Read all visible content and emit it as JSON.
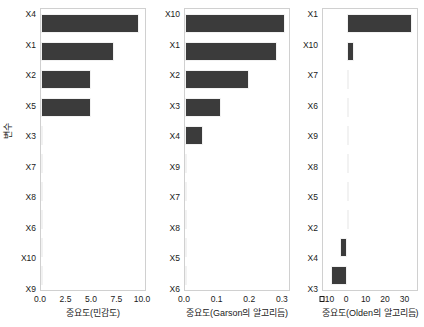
{
  "figure": {
    "y_axis_title": "변수",
    "bar_color": "#3b3b3b",
    "panel_border_color": "#d0d0d0"
  },
  "chart_data": [
    {
      "type": "bar",
      "orientation": "horizontal",
      "title": "",
      "xlabel": "중요도(민감도)",
      "ylabel": "변수",
      "xlim": [
        0.0,
        10.4
      ],
      "xticks": [
        0.0,
        2.5,
        5.0,
        7.5,
        10.0
      ],
      "xticklabels": [
        "0.0",
        "2.5",
        "5.0",
        "7.5",
        "10.0"
      ],
      "grid": false,
      "categories": [
        "X4",
        "X1",
        "X2",
        "X5",
        "X3",
        "X7",
        "X8",
        "X6",
        "X10",
        "X9"
      ],
      "values": [
        9.8,
        7.25,
        5.0,
        4.95,
        0.12,
        0.02,
        0.02,
        0.02,
        0.01,
        0.01
      ]
    },
    {
      "type": "bar",
      "orientation": "horizontal",
      "title": "",
      "xlabel": "중요도(Garson의 알고리듬)",
      "ylabel": "",
      "xlim": [
        0.0,
        0.325
      ],
      "xticks": [
        0.0,
        0.1,
        0.2,
        0.3
      ],
      "xticklabels": [
        "0.0",
        "0.1",
        "0.2",
        "0.3"
      ],
      "grid": false,
      "categories": [
        "X10",
        "X1",
        "X2",
        "X3",
        "X4",
        "X9",
        "X7",
        "X8",
        "X5",
        "X6"
      ],
      "values": [
        0.311,
        0.286,
        0.201,
        0.114,
        0.056,
        0.004,
        0.004,
        0.003,
        0.003,
        0.003
      ]
    },
    {
      "type": "bar",
      "orientation": "horizontal",
      "title": "",
      "xlabel": "중요도(Olden의 알고리듬)",
      "ylabel": "",
      "xlim": [
        -12.5,
        37.0
      ],
      "xticks": [
        -10,
        0,
        10,
        20,
        30
      ],
      "xticklabels": [
        "-10",
        "0",
        "10",
        "20",
        "30"
      ],
      "grid": false,
      "categories": [
        "X1",
        "X10",
        "X7",
        "X6",
        "X9",
        "X8",
        "X5",
        "X2",
        "X4",
        "X3"
      ],
      "values": [
        34.2,
        3.6,
        0.3,
        0.3,
        0.3,
        0.3,
        0.3,
        0.3,
        -3.5,
        -8.2
      ]
    }
  ]
}
